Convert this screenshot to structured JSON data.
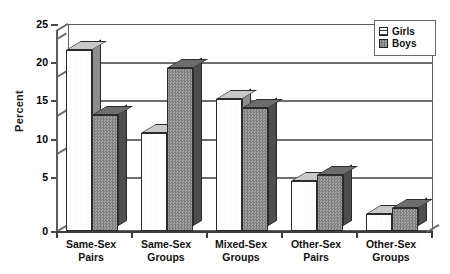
{
  "chart_data": {
    "type": "bar",
    "title": "",
    "xlabel": "",
    "ylabel": "Percent",
    "ylim": [
      0,
      25
    ],
    "yticks": [
      0,
      5,
      10,
      15,
      20,
      25
    ],
    "ytick_labels": [
      "0",
      "5",
      "10",
      "15",
      "20",
      "25"
    ],
    "grid": true,
    "legend_position": "top-right",
    "style": "3d-clustered-bar",
    "categories": [
      "Same-Sex Pairs",
      "Same-Sex Groups",
      "Mixed-Sex Groups",
      "Other-Sex Pairs",
      "Other-Sex Groups"
    ],
    "category_lines": [
      [
        "Same-Sex",
        "Pairs"
      ],
      [
        "Same-Sex",
        "Groups"
      ],
      [
        "Mixed-Sex",
        "Groups"
      ],
      [
        "Other-Sex",
        "Pairs"
      ],
      [
        "Other-Sex",
        "Groups"
      ]
    ],
    "series": [
      {
        "name": "Girls",
        "values": [
          21.8,
          11.8,
          15.9,
          6.0,
          2.0
        ],
        "color": "#fdfdfd",
        "pattern": "dashes"
      },
      {
        "name": "Boys",
        "values": [
          14.0,
          19.7,
          14.9,
          6.8,
          2.8
        ],
        "color": "#8f8f8f",
        "pattern": "checker"
      }
    ]
  },
  "axis": {
    "y_title": "Percent",
    "ticks": [
      "25",
      "20",
      "15",
      "10",
      "5",
      "0"
    ]
  },
  "legend": {
    "items": [
      {
        "label": "Girls"
      },
      {
        "label": "Boys"
      }
    ]
  },
  "colors": {
    "frame": "#5c5c5c",
    "grid": "#6e6e6e",
    "girls_face": "#fdfdfd",
    "boys_face": "#8f8f8f",
    "text": "#111111",
    "background": "#ffffff"
  }
}
